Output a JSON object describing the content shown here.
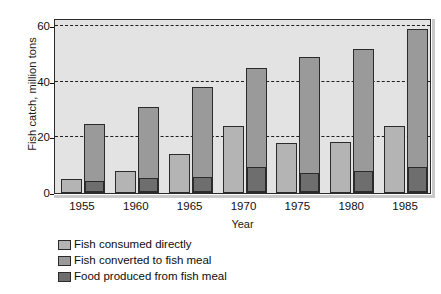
{
  "chart_data": {
    "type": "bar",
    "title": "",
    "subtitle": "",
    "xlabel": "Year",
    "ylabel": "Fish catch, million tons",
    "categories": [
      "1955",
      "1960",
      "1965",
      "1970",
      "1975",
      "1980",
      "1985"
    ],
    "series": [
      {
        "name": "Fish consumed directly",
        "color": "#b4b4b4",
        "values": [
          5,
          8,
          14,
          24,
          18,
          18.5,
          24
        ]
      },
      {
        "name": "Fish converted to fish meal",
        "color": "#9a9a9a",
        "values": [
          25,
          31,
          38,
          45,
          49,
          52,
          59
        ]
      },
      {
        "name": "Food produced from fish meal",
        "color": "#6e6e6e",
        "values": [
          4,
          5,
          5.5,
          9,
          7,
          7.5,
          9
        ]
      }
    ],
    "ylim": [
      0,
      63
    ],
    "yticks": [
      0,
      20,
      40,
      60
    ],
    "ytick_labels": [
      "0",
      "20",
      "40",
      "60"
    ],
    "grid": "horizontal-dashed",
    "grid_values": [
      20,
      40,
      60
    ],
    "legend_position": "below-left",
    "plot_background": "#e3e3e3",
    "axis_color": "#2b2b2b"
  },
  "legend": {
    "items": [
      {
        "label": "Fish consumed directly",
        "color": "#b4b4b4"
      },
      {
        "label": "Fish converted to fish meal",
        "color": "#9a9a9a"
      },
      {
        "label": "Food produced from fish meal",
        "color": "#6e6e6e"
      }
    ]
  }
}
